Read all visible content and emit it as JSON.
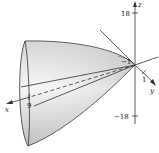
{
  "figure": {
    "colors": {
      "surface_light": "#f4f4f4",
      "surface_dark": "#c9c9c9",
      "line": "#333333"
    },
    "axes": {
      "x": {
        "label": "x",
        "tick_label": "9"
      },
      "y": {
        "label": "y",
        "tick_label": "1"
      },
      "z": {
        "label": "z",
        "tick_top": "18",
        "tick_bottom": "−18"
      },
      "neg_y_tick_label": "−1"
    }
  }
}
